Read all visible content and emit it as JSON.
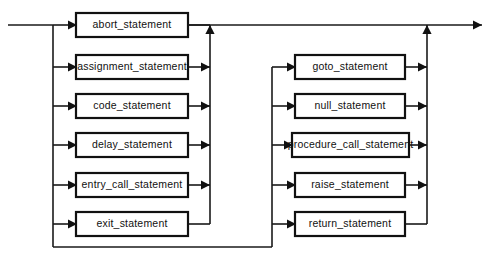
{
  "diagram": {
    "type": "railroad-syntax-diagram",
    "colors": {
      "line": "#1a1a1a",
      "box_border": "#111111",
      "box_fill": "#ffffff",
      "text": "#111111",
      "background": "#ffffff"
    },
    "entry": {
      "name": "entry-line",
      "from_x": 8,
      "to_x": 53,
      "y": 25
    },
    "exit": {
      "name": "exit-line",
      "from_x": 427,
      "to_x": 482,
      "y": 25,
      "arrow": "right"
    },
    "groups": [
      {
        "name": "left-alternatives-group",
        "left_rail_x": 53,
        "right_rail_x": 210,
        "box_left_x": 76,
        "box_right_x": 188,
        "bottom_return_y": 247,
        "options": [
          {
            "id": "abort-statement",
            "label": "abort_statement",
            "row_y": 25,
            "entry_arrow": true,
            "exit_arrow": false,
            "on_main_line": true
          },
          {
            "id": "assignment-statement",
            "label": "assignment_statement",
            "row_y": 67,
            "entry_arrow": true,
            "exit_arrow": true,
            "on_main_line": false
          },
          {
            "id": "code-statement",
            "label": "code_statement",
            "row_y": 106,
            "entry_arrow": true,
            "exit_arrow": true,
            "on_main_line": false
          },
          {
            "id": "delay-statement",
            "label": "delay_statement",
            "row_y": 145,
            "entry_arrow": true,
            "exit_arrow": true,
            "on_main_line": false
          },
          {
            "id": "entry-call-statement",
            "label": "entry_call_statement",
            "row_y": 185,
            "entry_arrow": true,
            "exit_arrow": true,
            "on_main_line": false
          },
          {
            "id": "exit-statement",
            "label": "exit_statement",
            "row_y": 224,
            "entry_arrow": true,
            "exit_arrow": false,
            "on_main_line": false
          }
        ]
      },
      {
        "name": "right-alternatives-group",
        "left_rail_x": 272,
        "right_rail_x": 427,
        "box_left_x": 295,
        "box_right_x": 405,
        "bottom_return_y": 247,
        "options": [
          {
            "id": "goto-statement",
            "label": "goto_statement",
            "row_y": 67,
            "entry_arrow": true,
            "exit_arrow": true,
            "wide": false
          },
          {
            "id": "null-statement",
            "label": "null_statement",
            "row_y": 106,
            "entry_arrow": true,
            "exit_arrow": true,
            "wide": false
          },
          {
            "id": "procedure-call-statement",
            "label": "procedure_call_statement",
            "row_y": 145,
            "entry_arrow": true,
            "exit_arrow": true,
            "wide": true
          },
          {
            "id": "raise-statement",
            "label": "raise_statement",
            "row_y": 185,
            "entry_arrow": true,
            "exit_arrow": true,
            "wide": false
          },
          {
            "id": "return-statement",
            "label": "return_statement",
            "row_y": 224,
            "entry_arrow": true,
            "exit_arrow": false,
            "wide": false
          }
        ]
      }
    ],
    "box_height": 24,
    "wide_box_left_x": 292,
    "wide_box_right_x": 409
  }
}
